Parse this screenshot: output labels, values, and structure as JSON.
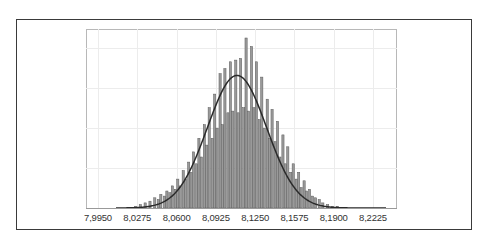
{
  "chart_data": {
    "type": "bar",
    "subtype": "histogram_with_normal_fit",
    "title": "",
    "xlabel": "",
    "ylabel": "",
    "x_tick_labels": [
      "7,9950",
      "8,0275",
      "8,0600",
      "8,0925",
      "8,1250",
      "8,1575",
      "8,1900",
      "8,2225"
    ],
    "x_ticks": [
      7.995,
      8.0275,
      8.06,
      8.0925,
      8.125,
      8.1575,
      8.19,
      8.2225
    ],
    "xlim": [
      7.985,
      8.24
    ],
    "ylim": [
      0,
      1.0
    ],
    "y_tick_labels": [],
    "grid": true,
    "legend": null,
    "bar_color": "#9a9a9a",
    "bar_edge_color": "#5a5a5a",
    "curve_color": "#2a2a2a",
    "fit_curve": {
      "type": "normal",
      "mean": 8.11,
      "peak_relative_height": 0.78,
      "sd": 0.0245
    },
    "bins": {
      "width": 0.00205,
      "centers": [
        8.026,
        8.03,
        8.034,
        8.038,
        8.042,
        8.045,
        8.047,
        8.05,
        8.052,
        8.0545,
        8.0565,
        8.059,
        8.061,
        8.063,
        8.0655,
        8.0675,
        8.07,
        8.072,
        8.074,
        8.0765,
        8.0785,
        8.0805,
        8.083,
        8.085,
        8.087,
        8.0895,
        8.0915,
        8.0935,
        8.096,
        8.098,
        8.1,
        8.1025,
        8.1045,
        8.1065,
        8.109,
        8.111,
        8.113,
        8.1155,
        8.1175,
        8.1195,
        8.122,
        8.124,
        8.126,
        8.1285,
        8.1305,
        8.1325,
        8.135,
        8.137,
        8.139,
        8.1415,
        8.1435,
        8.1455,
        8.148,
        8.15,
        8.152,
        8.1545,
        8.1565,
        8.159,
        8.161,
        8.163,
        8.1655,
        8.1675,
        8.17,
        8.1725,
        8.175,
        8.178,
        8.181,
        8.185,
        8.189,
        8.193
      ],
      "relative_heights": [
        0.01,
        0.02,
        0.03,
        0.04,
        0.06,
        0.05,
        0.08,
        0.07,
        0.1,
        0.09,
        0.13,
        0.11,
        0.17,
        0.13,
        0.22,
        0.17,
        0.27,
        0.21,
        0.33,
        0.26,
        0.41,
        0.3,
        0.49,
        0.37,
        0.59,
        0.41,
        0.67,
        0.47,
        0.79,
        0.49,
        0.82,
        0.56,
        0.86,
        0.57,
        0.87,
        0.56,
        0.88,
        0.59,
        1.0,
        0.57,
        0.95,
        0.59,
        0.86,
        0.52,
        0.77,
        0.47,
        0.64,
        0.41,
        0.58,
        0.39,
        0.51,
        0.3,
        0.43,
        0.26,
        0.36,
        0.21,
        0.26,
        0.17,
        0.21,
        0.12,
        0.16,
        0.1,
        0.11,
        0.07,
        0.06,
        0.05,
        0.03,
        0.02,
        0.01,
        0.01
      ]
    }
  }
}
